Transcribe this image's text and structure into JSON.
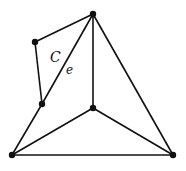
{
  "diagram": {
    "type": "graph",
    "vertices": [
      {
        "id": "top",
        "x": 93,
        "y": 14
      },
      {
        "id": "upper_left",
        "x": 35,
        "y": 42
      },
      {
        "id": "mid_left",
        "x": 42,
        "y": 104
      },
      {
        "id": "center",
        "x": 93,
        "y": 108
      },
      {
        "id": "bottom_left",
        "x": 12,
        "y": 155
      },
      {
        "id": "bottom_right",
        "x": 173,
        "y": 155
      }
    ],
    "edges": [
      [
        "top",
        "upper_left"
      ],
      [
        "upper_left",
        "mid_left"
      ],
      [
        "mid_left",
        "top"
      ],
      [
        "mid_left",
        "bottom_left"
      ],
      [
        "top",
        "center"
      ],
      [
        "top",
        "bottom_right"
      ],
      [
        "center",
        "bottom_left"
      ],
      [
        "center",
        "bottom_right"
      ],
      [
        "bottom_left",
        "bottom_right"
      ]
    ],
    "labels": {
      "cycle": "C",
      "edge": "e"
    }
  }
}
